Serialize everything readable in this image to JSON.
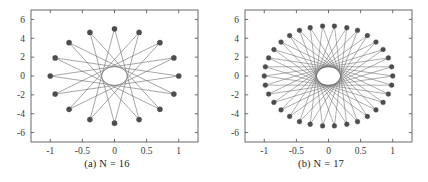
{
  "figure": {
    "background_color": "#ffffff",
    "panels": [
      {
        "id": "a",
        "caption": "(a)  N = 16",
        "caption_prefix": "(a)",
        "caption_text": "N = 16"
      },
      {
        "id": "b",
        "caption": "(b)  N = 17",
        "caption_prefix": "(b)",
        "caption_text": "N = 17"
      }
    ]
  },
  "chart_data": [
    {
      "type": "scatter",
      "title": "(a)  N = 16",
      "subtitle": "",
      "xlabel": "",
      "ylabel": "",
      "xlim": [
        -1.3,
        1.3
      ],
      "ylim": [
        -7.0,
        7.0
      ],
      "xticks": [
        -1,
        -0.5,
        0,
        0.5,
        1
      ],
      "xticklabels": [
        "-1",
        "-0.5",
        "0",
        "0.5",
        "1"
      ],
      "yticks": [
        6,
        4,
        2,
        0,
        -2,
        -4,
        -6
      ],
      "yticklabels": [
        "6",
        "4",
        "2",
        "0",
        "-2",
        "-4",
        "-6"
      ],
      "grid": false,
      "legend": null,
      "marker_color": "#4d4d4d",
      "line_color": "#6b6b6b",
      "marker_size": 2.6,
      "line_width": 0.6,
      "N": 16,
      "star_step": 7,
      "semi_axis_x": 1.0,
      "semi_axis_y": 5.0,
      "description": "Star polygon {16/7} drawn on an ellipse: 16 vertices at angles 2*pi*k/16, x = cos(theta), y = 5*sin(theta); each vertex joined to the vertex 7 steps away, producing an unfilled elliptical envelope at the centre.",
      "x": [
        1.0,
        0.924,
        0.707,
        0.383,
        0.0,
        -0.383,
        -0.707,
        -0.924,
        -1.0,
        -0.924,
        -0.707,
        -0.383,
        0.0,
        0.383,
        0.707,
        0.924
      ],
      "y": [
        0.0,
        1.913,
        3.536,
        4.619,
        5.0,
        4.619,
        3.536,
        1.913,
        0.0,
        -1.913,
        -3.536,
        -4.619,
        -5.0,
        -4.619,
        -3.536,
        -1.913
      ]
    },
    {
      "type": "scatter",
      "title": "(b)  N = 17",
      "subtitle": "",
      "xlabel": "",
      "ylabel": "",
      "xlim": [
        -1.3,
        1.3
      ],
      "ylim": [
        -7.0,
        7.0
      ],
      "xticks": [
        -1,
        -0.5,
        0,
        0.5,
        1
      ],
      "xticklabels": [
        "-1",
        "-0.5",
        "0",
        "0.5",
        "1"
      ],
      "yticks": [
        6,
        4,
        2,
        0,
        -2,
        -4,
        -6
      ],
      "yticklabels": [
        "6",
        "4",
        "2",
        "0",
        "-2",
        "-4",
        "-6"
      ],
      "grid": false,
      "legend": null,
      "marker_color": "#4d4d4d",
      "line_color": "#6b6b6b",
      "marker_size": 2.4,
      "line_width": 0.55,
      "N": 17,
      "star_step": 15,
      "num_vertices": 34,
      "semi_axis_x": 1.0,
      "semi_axis_y": 5.3,
      "description": "Star polygon {34/15} drawn on an ellipse: 34 vertices at angles 2*pi*k/34, x = cos(theta), y = 5.3*sin(theta); each vertex joined to the vertex 15 steps away, producing a denser rosette with an unfilled elliptical envelope at the centre.",
      "x": [
        1.0,
        0.983,
        0.932,
        0.85,
        0.739,
        0.605,
        0.452,
        0.285,
        0.092,
        -0.092,
        -0.285,
        -0.452,
        -0.605,
        -0.739,
        -0.85,
        -0.932,
        -0.983,
        -1.0,
        -0.983,
        -0.932,
        -0.85,
        -0.739,
        -0.605,
        -0.452,
        -0.285,
        -0.092,
        0.092,
        0.285,
        0.452,
        0.605,
        0.739,
        0.85,
        0.932,
        0.983
      ],
      "y": [
        0.0,
        0.974,
        1.918,
        2.803,
        3.6,
        4.288,
        4.844,
        5.12,
        5.29,
        5.29,
        5.12,
        4.844,
        4.288,
        3.6,
        2.803,
        1.918,
        0.974,
        0.0,
        -0.974,
        -1.918,
        -2.803,
        -3.6,
        -4.288,
        -4.844,
        -5.12,
        -5.29,
        -5.29,
        -5.12,
        -4.844,
        -4.288,
        -3.6,
        -2.803,
        -1.918,
        -0.974
      ]
    }
  ]
}
